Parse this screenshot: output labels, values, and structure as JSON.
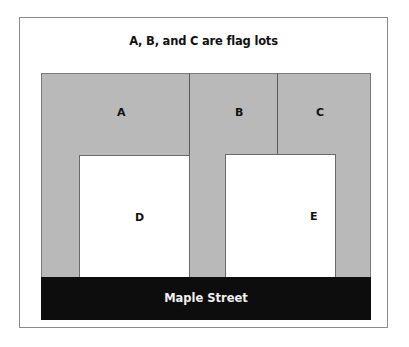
{
  "diagram": {
    "title": "A, B, and C are flag lots",
    "lots": [
      {
        "id": "A",
        "label": "A",
        "type": "flag lot",
        "fill": "#b9b9b9"
      },
      {
        "id": "B",
        "label": "B",
        "type": "flag lot",
        "fill": "#b9b9b9"
      },
      {
        "id": "C",
        "label": "C",
        "type": "flag lot",
        "fill": "#b9b9b9"
      },
      {
        "id": "D",
        "label": "D",
        "type": "street-front lot",
        "fill": "#ffffff"
      },
      {
        "id": "E",
        "label": "E",
        "type": "street-front lot",
        "fill": "#ffffff"
      }
    ],
    "street": {
      "label": "Maple Street",
      "fill": "#0d0d0d"
    }
  }
}
